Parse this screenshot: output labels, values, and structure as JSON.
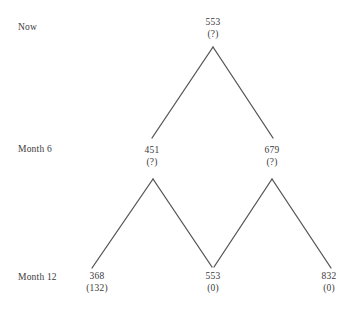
{
  "figure": {
    "type": "binomial-tree-diagram",
    "background_color": "#ffffff",
    "line_color": "#555555",
    "text_color": "#3b3b3b"
  },
  "period_labels": [
    {
      "id": "now",
      "text": "Now",
      "x": 18,
      "y": 22
    },
    {
      "id": "month6",
      "text": "Month 6",
      "x": 18,
      "y": 144
    },
    {
      "id": "month12",
      "text": "Month 12",
      "x": 18,
      "y": 272
    }
  ],
  "nodes": [
    {
      "id": "root",
      "level": "Now",
      "value": "553",
      "payoff": "(?)",
      "x": 213,
      "y": 16,
      "apex_x": 213,
      "apex_y": 46
    },
    {
      "id": "up-6",
      "level": "Month 6",
      "value": "451",
      "payoff": "(?)",
      "x": 152,
      "y": 144,
      "apex_x": 153,
      "apex_y": 178
    },
    {
      "id": "down-6",
      "level": "Month 6",
      "value": "679",
      "payoff": "(?)",
      "x": 272,
      "y": 144,
      "apex_x": 272,
      "apex_y": 178
    },
    {
      "id": "down-down-12",
      "level": "Month 12",
      "value": "368",
      "payoff": "(132)",
      "x": 97,
      "y": 270,
      "apex_x": 93,
      "apex_y": 267
    },
    {
      "id": "mid-12",
      "level": "Month 12",
      "value": "553",
      "payoff": "(0)",
      "x": 213,
      "y": 270,
      "apex_x": 213,
      "apex_y": 267
    },
    {
      "id": "up-up-12",
      "level": "Month 12",
      "value": "832",
      "payoff": "(0)",
      "x": 329,
      "y": 270,
      "apex_x": 330,
      "apex_y": 268
    }
  ],
  "branches": [
    {
      "id": "root-to-451",
      "x1": 213,
      "y1": 47,
      "x2": 152,
      "y2": 138
    },
    {
      "id": "root-to-679",
      "x1": 213,
      "y1": 47,
      "x2": 273,
      "y2": 138
    },
    {
      "id": "451-to-368",
      "x1": 153,
      "y1": 179,
      "x2": 92,
      "y2": 268
    },
    {
      "id": "451-to-553",
      "x1": 153,
      "y1": 179,
      "x2": 212,
      "y2": 267
    },
    {
      "id": "679-to-553",
      "x1": 272,
      "y1": 179,
      "x2": 214,
      "y2": 267
    },
    {
      "id": "679-to-832",
      "x1": 272,
      "y1": 179,
      "x2": 331,
      "y2": 268
    }
  ],
  "chart_data": {
    "type": "diagram",
    "title": "",
    "levels": [
      "Now",
      "Month 6",
      "Month 12"
    ],
    "tree": {
      "Now": [
        {
          "value": 553,
          "payoff": "?"
        }
      ],
      "Month 6": [
        {
          "value": 451,
          "payoff": "?"
        },
        {
          "value": 679,
          "payoff": "?"
        }
      ],
      "Month 12": [
        {
          "value": 368,
          "payoff": 132
        },
        {
          "value": 553,
          "payoff": 0
        },
        {
          "value": 832,
          "payoff": 0
        }
      ]
    }
  }
}
